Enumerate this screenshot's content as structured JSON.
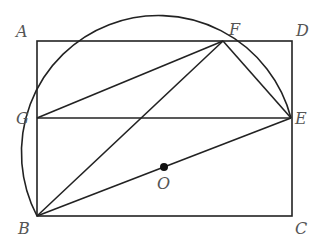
{
  "diagram": {
    "points": {
      "A": {
        "label": "A",
        "x": 37,
        "y": 41
      },
      "D": {
        "label": "D",
        "x": 292,
        "y": 41
      },
      "C": {
        "label": "C",
        "x": 292,
        "y": 216
      },
      "B": {
        "label": "B",
        "x": 37,
        "y": 216
      },
      "G": {
        "label": "G",
        "x": 37,
        "y": 118
      },
      "E": {
        "label": "E",
        "x": 291,
        "y": 118
      },
      "F": {
        "label": "F",
        "x": 223,
        "y": 41
      },
      "O": {
        "label": "O",
        "x": 164,
        "y": 167
      }
    },
    "segments": [
      "AD",
      "DC",
      "CB",
      "BA",
      "GE",
      "GF",
      "BF",
      "FE",
      "BO",
      "OE"
    ],
    "arc": {
      "center": "O",
      "from": "B",
      "to": "E",
      "through": [
        "G",
        "F"
      ],
      "radius": 137
    }
  }
}
